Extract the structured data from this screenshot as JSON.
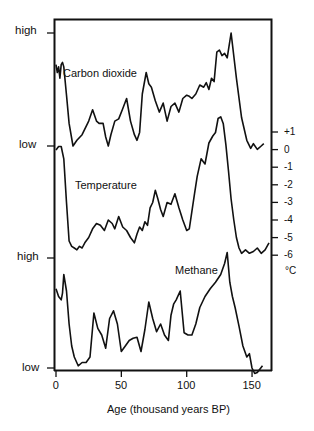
{
  "chart_data": {
    "type": "line",
    "title": "",
    "xlabel": "Age (thousand years BP)",
    "xticks": [
      0,
      50,
      100,
      150
    ],
    "xlim": [
      0,
      165
    ],
    "grid": false,
    "legend": "none (series labeled inline)",
    "left_axis_labels": [
      {
        "series": "Carbon dioxide",
        "top": "high",
        "bottom": "low"
      },
      {
        "series": "Methane",
        "top": "high",
        "bottom": "low"
      }
    ],
    "right_axis": {
      "series": "Temperature",
      "unit": "°C",
      "ticks": [
        "+1",
        "0",
        "-1",
        "-2",
        "-3",
        "-4",
        "-5",
        "-6"
      ]
    },
    "series": [
      {
        "name": "Carbon dioxide",
        "scale": "relative (low–high)",
        "x": [
          0,
          1,
          2,
          3,
          4,
          5,
          6,
          8,
          10,
          13,
          16,
          20,
          25,
          28,
          31,
          33,
          36,
          38,
          40,
          42,
          45,
          48,
          51,
          54,
          57,
          60,
          62,
          64,
          66,
          69,
          71,
          73,
          76,
          79,
          82,
          85,
          88,
          91,
          94,
          97,
          100,
          102,
          104,
          107,
          110,
          113,
          115,
          117,
          119,
          121,
          123,
          125,
          127,
          129,
          131,
          134,
          138,
          142,
          146,
          149,
          151,
          154,
          157,
          159
        ],
        "values": [
          0.72,
          0.65,
          0.7,
          0.6,
          0.72,
          0.74,
          0.7,
          0.45,
          0.2,
          0.0,
          0.05,
          0.1,
          0.22,
          0.32,
          0.22,
          0.2,
          0.2,
          0.08,
          0.0,
          0.1,
          0.22,
          0.24,
          0.33,
          0.42,
          0.22,
          0.1,
          0.05,
          0.12,
          0.46,
          0.65,
          0.55,
          0.52,
          0.4,
          0.3,
          0.38,
          0.22,
          0.35,
          0.38,
          0.3,
          0.42,
          0.45,
          0.44,
          0.42,
          0.46,
          0.54,
          0.52,
          0.56,
          0.5,
          0.6,
          0.57,
          0.83,
          0.85,
          0.8,
          0.82,
          0.78,
          1.0,
          0.6,
          0.25,
          0.05,
          -0.02,
          0.02,
          -0.03,
          0.0,
          0.02
        ]
      },
      {
        "name": "Temperature",
        "unit": "°C",
        "x": [
          0,
          2,
          4,
          6,
          8,
          10,
          12,
          14,
          16,
          18,
          20,
          22,
          25,
          28,
          31,
          34,
          37,
          40,
          43,
          45,
          48,
          51,
          54,
          57,
          60,
          62,
          64,
          66,
          68,
          70,
          72,
          74,
          76,
          78,
          80,
          82,
          85,
          88,
          91,
          94,
          97,
          100,
          102,
          104,
          106,
          108,
          111,
          114,
          117,
          120,
          122,
          124,
          126,
          128,
          130,
          132,
          134,
          136,
          138,
          140,
          142,
          145,
          148,
          151,
          154,
          157,
          160,
          163
        ],
        "values": [
          0.0,
          0.2,
          0.2,
          -0.5,
          -3.0,
          -5.2,
          -5.5,
          -5.6,
          -5.7,
          -5.5,
          -5.6,
          -5.3,
          -5.0,
          -4.5,
          -4.2,
          -4.3,
          -4.6,
          -4.0,
          -4.2,
          -4.5,
          -3.8,
          -4.4,
          -4.6,
          -5.0,
          -5.3,
          -4.8,
          -4.4,
          -4.6,
          -4.1,
          -4.3,
          -3.3,
          -3.0,
          -2.3,
          -2.8,
          -3.4,
          -3.8,
          -3.0,
          -3.1,
          -2.5,
          -3.3,
          -4.0,
          -4.6,
          -4.5,
          -3.5,
          -2.5,
          -1.5,
          -0.5,
          -0.8,
          0.4,
          0.8,
          1.0,
          1.8,
          1.9,
          1.5,
          0.3,
          -1.2,
          -2.8,
          -4.0,
          -5.0,
          -5.6,
          -5.9,
          -5.7,
          -5.9,
          -5.8,
          -5.6,
          -5.9,
          -5.7,
          -5.3
        ]
      },
      {
        "name": "Methane",
        "scale": "relative (low–high)",
        "x": [
          0,
          2,
          4,
          5,
          6,
          8,
          10,
          12,
          14,
          17,
          20,
          23,
          26,
          29,
          32,
          35,
          38,
          41,
          44,
          47,
          50,
          53,
          56,
          59,
          62,
          65,
          68,
          71,
          74,
          77,
          80,
          83,
          86,
          88,
          90,
          92,
          95,
          98,
          101,
          104,
          107,
          110,
          114,
          118,
          122,
          126,
          129,
          131,
          133,
          135,
          137,
          140,
          143,
          146,
          148,
          150,
          152,
          154,
          158
        ],
        "values": [
          0.72,
          0.65,
          0.62,
          0.68,
          0.85,
          0.7,
          0.4,
          0.2,
          0.1,
          0.02,
          0.05,
          0.05,
          0.1,
          0.5,
          0.36,
          0.3,
          0.18,
          0.45,
          0.52,
          0.4,
          0.15,
          0.2,
          0.25,
          0.27,
          0.28,
          0.15,
          0.35,
          0.6,
          0.45,
          0.33,
          0.4,
          0.3,
          0.25,
          0.48,
          0.58,
          0.62,
          0.7,
          0.32,
          0.3,
          0.3,
          0.4,
          0.55,
          0.65,
          0.72,
          0.78,
          0.85,
          0.95,
          1.05,
          0.78,
          0.65,
          0.55,
          0.38,
          0.2,
          0.1,
          0.13,
          0.0,
          -0.05,
          -0.04,
          0.02
        ]
      }
    ],
    "annotations": [
      "Carbon dioxide",
      "Temperature",
      "Methane"
    ]
  },
  "labels": {
    "co2_high": "high",
    "co2_low": "low",
    "ch4_high": "high",
    "ch4_low": "low",
    "co2_name": "Carbon dioxide",
    "temp_name": "Temperature",
    "ch4_name": "Methane",
    "unit": "°C",
    "xlabel": "Age (thousand years BP)",
    "xticks": [
      "0",
      "50",
      "100",
      "150"
    ],
    "rticks": [
      "+1",
      "0",
      "-1",
      "-2",
      "-3",
      "-4",
      "-5",
      "-6"
    ]
  }
}
